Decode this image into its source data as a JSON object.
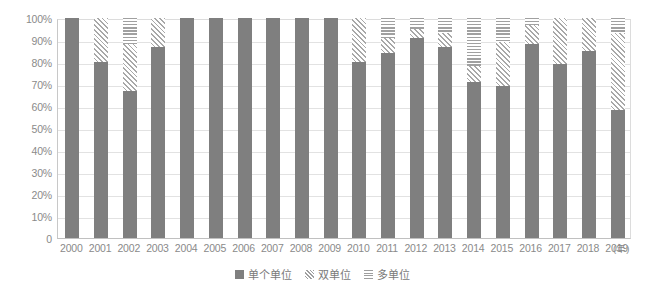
{
  "chart_data": {
    "type": "bar",
    "stacked": true,
    "title": "",
    "subtitle": "",
    "xlabel": "(年)",
    "ylabel": "",
    "ylim": [
      0,
      100
    ],
    "grid": true,
    "legend_position": "bottom",
    "categories": [
      "2000",
      "2001",
      "2002",
      "2003",
      "2004",
      "2005",
      "2006",
      "2007",
      "2008",
      "2009",
      "2010",
      "2011",
      "2012",
      "2013",
      "2014",
      "2015",
      "2016",
      "2017",
      "2018",
      "2019"
    ],
    "ytick_labels": [
      "0",
      "10%",
      "20%",
      "30%",
      "40%",
      "50%",
      "60%",
      "70%",
      "80%",
      "90%",
      "100%"
    ],
    "ytick_values": [
      0,
      10,
      20,
      30,
      40,
      50,
      60,
      70,
      80,
      90,
      100
    ],
    "series": [
      {
        "name": "单个单位",
        "fill": "solid",
        "color": "#7f7f7f",
        "values": [
          100,
          80,
          67,
          87,
          100,
          100,
          100,
          100,
          100,
          100,
          80,
          84,
          91,
          87,
          71,
          69,
          88,
          79,
          85,
          58
        ]
      },
      {
        "name": "双单位",
        "fill": "diagonal-hatch",
        "color": "#a8a8a8",
        "values": [
          0,
          20,
          21,
          13,
          0,
          0,
          0,
          0,
          0,
          0,
          20,
          7,
          4,
          6,
          7,
          20,
          9,
          21,
          15,
          35
        ]
      },
      {
        "name": "多单位",
        "fill": "horizontal-hatch",
        "color": "#a0a0a0",
        "values": [
          0,
          0,
          12,
          0,
          0,
          0,
          0,
          0,
          0,
          0,
          0,
          9,
          5,
          7,
          22,
          11,
          3,
          0,
          0,
          7
        ]
      }
    ]
  },
  "legend": {
    "items": [
      {
        "label": "单个单位",
        "swatch": "solid-square-icon"
      },
      {
        "label": "双单位",
        "swatch": "diagonal-hatch-square-icon"
      },
      {
        "label": "多单位",
        "swatch": "horizontal-hatch-square-icon"
      }
    ]
  }
}
